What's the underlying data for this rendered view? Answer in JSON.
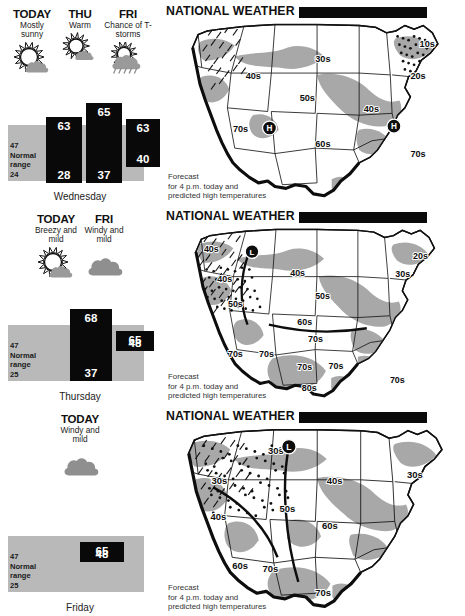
{
  "panels": [
    {
      "id": "wednesday",
      "day_label": "Wednesday",
      "columns": [
        {
          "name": "TODAY",
          "cond": "Mostly sunny",
          "icon": "sun-cloud-icon",
          "hi": "63",
          "lo": "28"
        },
        {
          "name": "THU",
          "cond": "Warm",
          "icon": "sun-small-cloud-icon",
          "hi": "65",
          "lo": "37"
        },
        {
          "name": "FRI",
          "cond": "Chance of T-storms",
          "icon": "sun-cloud-rain-icon",
          "hi": "63",
          "lo": "40"
        }
      ],
      "normal": {
        "high": "47",
        "low": "24",
        "label_line1": "Normal",
        "label_line2": "range"
      },
      "map": {
        "title": "NATIONAL WEATHER",
        "caption_lines": [
          "Forecast",
          "for 4 p.m. today and",
          "predicted high temperatures"
        ],
        "temp_labels": [
          {
            "text": "40s",
            "x": 72,
            "y": 64
          },
          {
            "text": "30s",
            "x": 148,
            "y": 46
          },
          {
            "text": "50s",
            "x": 131,
            "y": 88
          },
          {
            "text": "40s",
            "x": 201,
            "y": 101
          },
          {
            "text": "60s",
            "x": 148,
            "y": 139
          },
          {
            "text": "70s",
            "x": 58,
            "y": 122
          },
          {
            "text": "10s",
            "x": 262,
            "y": 30
          },
          {
            "text": "20s",
            "x": 252,
            "y": 65
          },
          {
            "text": "70s",
            "x": 252,
            "y": 150
          }
        ],
        "pressure_markers": [
          {
            "type": "H",
            "x": 98,
            "y": 118
          },
          {
            "type": "H",
            "x": 234,
            "y": 116
          }
        ]
      }
    },
    {
      "id": "thursday",
      "day_label": "Thursday",
      "columns": [
        {
          "name": "TODAY",
          "cond": "Breezy and mild",
          "icon": "sun-cloud-icon",
          "hi": "68",
          "lo": "37"
        },
        {
          "name": "FRI",
          "cond": "Windy and mild",
          "icon": "cloud-icon",
          "hi": "65",
          "lo": "48"
        }
      ],
      "normal": {
        "high": "47",
        "low": "25",
        "label_line1": "Normal",
        "label_line2": "range"
      },
      "map": {
        "title": "NATIONAL WEATHER",
        "caption_lines": [
          "Forecast",
          "for 4 p.m. today and",
          "predicted high temperatures"
        ],
        "temp_labels": [
          {
            "text": "40s",
            "x": 23,
            "y": 30
          },
          {
            "text": "40s",
            "x": 38,
            "y": 64
          },
          {
            "text": "50s",
            "x": 50,
            "y": 92
          },
          {
            "text": "40s",
            "x": 120,
            "y": 57
          },
          {
            "text": "50s",
            "x": 148,
            "y": 83
          },
          {
            "text": "60s",
            "x": 128,
            "y": 112
          },
          {
            "text": "70s",
            "x": 140,
            "y": 132
          },
          {
            "text": "70s",
            "x": 50,
            "y": 148
          },
          {
            "text": "70s",
            "x": 85,
            "y": 148
          },
          {
            "text": "70s",
            "x": 128,
            "y": 163
          },
          {
            "text": "70s",
            "x": 163,
            "y": 162
          },
          {
            "text": "80s",
            "x": 133,
            "y": 186
          },
          {
            "text": "70s",
            "x": 232,
            "y": 177
          },
          {
            "text": "20s",
            "x": 258,
            "y": 38
          },
          {
            "text": "30s",
            "x": 238,
            "y": 58
          }
        ],
        "pressure_markers": [
          {
            "type": "L",
            "x": 77,
            "y": 30
          }
        ]
      }
    },
    {
      "id": "friday",
      "day_label": "Friday",
      "columns": [
        {
          "name": "TODAY",
          "cond": "Windy and mild",
          "icon": "cloud-icon",
          "hi": "65",
          "lo": "48"
        }
      ],
      "normal": {
        "high": "47",
        "low": "25",
        "label_line1": "Normal",
        "label_line2": "range"
      },
      "map": {
        "title": "NATIONAL WEATHER",
        "caption_lines": [
          "Forecast",
          "for 4 p.m. today and",
          "predicted high temperatures"
        ],
        "temp_labels": [
          {
            "text": "30s",
            "x": 98,
            "y": 31
          },
          {
            "text": "30s",
            "x": 38,
            "y": 62
          },
          {
            "text": "40s",
            "x": 160,
            "y": 62
          },
          {
            "text": "30s",
            "x": 245,
            "y": 56
          },
          {
            "text": "50s",
            "x": 110,
            "y": 92
          },
          {
            "text": "40s",
            "x": 37,
            "y": 101
          },
          {
            "text": "60s",
            "x": 60,
            "y": 152
          },
          {
            "text": "60s",
            "x": 155,
            "y": 110
          },
          {
            "text": "70s",
            "x": 92,
            "y": 156
          },
          {
            "text": "70s",
            "x": 148,
            "y": 181
          }
        ],
        "pressure_markers": [
          {
            "type": "L",
            "x": 120,
            "y": 23
          }
        ]
      }
    }
  ],
  "colors": {
    "bar_fill": "#090909",
    "normal_range_fill": "#b9b9b9",
    "map_shade": "#a8a8a8",
    "map_land": "#ffffff",
    "outline": "#111111"
  }
}
